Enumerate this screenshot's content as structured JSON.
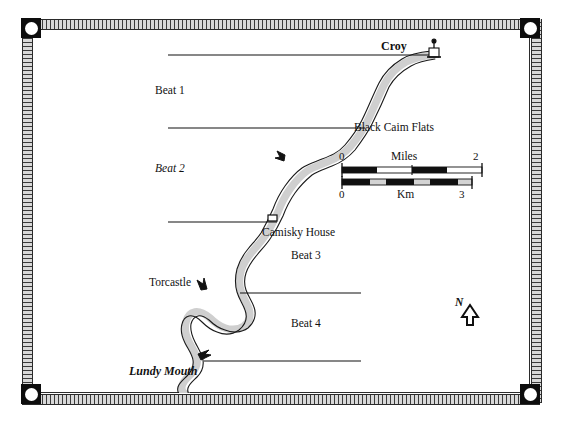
{
  "figure": {
    "kind": "map",
    "background_color": "#ffffff",
    "ink_color": "#111111",
    "river_fill_color": "#cfcfcf",
    "river_outline_color": "#111111",
    "frame_band_color": "#d8d8d8",
    "corner_marker_color": "#0d0d0d"
  },
  "beats": [
    {
      "label": "Beat 1",
      "name": "Beat 1",
      "italic_number": false
    },
    {
      "label": "Beat 2",
      "name": "Beat 2",
      "italic_number": true
    },
    {
      "label": "Beat 3",
      "name": "Beat 3",
      "italic_number": false
    },
    {
      "label": "Beat 4",
      "name": "Beat 4",
      "italic_number": false
    }
  ],
  "places": [
    {
      "label": "Croy",
      "style": "bold"
    },
    {
      "label": "Black Caim Flats",
      "style": "regular"
    },
    {
      "label": "Camisky House",
      "style": "regular"
    },
    {
      "label": "Torcastle",
      "style": "regular"
    },
    {
      "label": "Lundy Mouth",
      "style": "bold-italic"
    }
  ],
  "scale_bar": {
    "miles": {
      "caption": "Miles",
      "min_label": "0",
      "max_label": "2",
      "min_value": 0,
      "max_value": 2,
      "segments": 4
    },
    "km": {
      "caption": "Km",
      "min_label": "0",
      "max_label": "3",
      "min_value": 0,
      "max_value": 3,
      "segments": 6
    }
  },
  "compass": {
    "label": "N",
    "icon": "north-arrow-icon",
    "direction": "up"
  },
  "symbols": {
    "building": "building-square-icon",
    "bridge": "bridge-icon",
    "tributary": "tributary-icon"
  },
  "divider_lines": {
    "count": 5,
    "description": "Horizontal beat boundary lines running from the left margin to the river"
  }
}
